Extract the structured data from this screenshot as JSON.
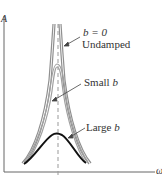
{
  "diagram": {
    "axes": {
      "y_label": "A",
      "x_label": "ω"
    },
    "curves": [
      {
        "id": "undamped",
        "label_line1": "b = 0",
        "label_line2": "Undamped",
        "color": "#8c8c8c",
        "peak": "infinite"
      },
      {
        "id": "small",
        "label_line1": "Small",
        "label_var": "b",
        "color": "#9a9a9a",
        "peak": "high"
      },
      {
        "id": "large",
        "label_line1": "Large",
        "label_var": "b",
        "color": "#1a1a1a",
        "peak": "low"
      }
    ],
    "colors": {
      "axis": "#555555",
      "dashed_line": "#9a9a9a",
      "curve_gray": "#8f8f8f",
      "curve_black": "#111111",
      "text": "#333333"
    }
  }
}
